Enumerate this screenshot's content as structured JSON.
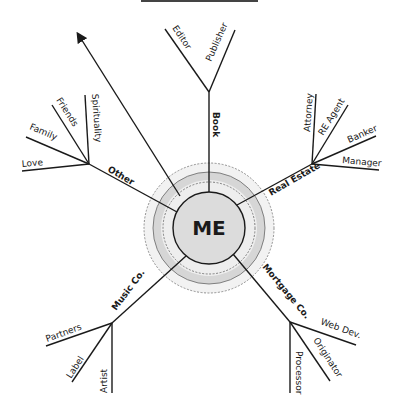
{
  "center": {
    "label": "ME"
  },
  "branches": {
    "book": {
      "label": "Book",
      "leaves": [
        "Editor",
        "Publisher"
      ]
    },
    "real_estate": {
      "label": "Real Estate",
      "leaves": [
        "Attorney",
        "RE Agent",
        "Banker",
        "Manager"
      ]
    },
    "mortgage": {
      "label": "Mortgage Co.",
      "leaves": [
        "Web Dev.",
        "Originator",
        "Processor"
      ]
    },
    "music": {
      "label": "Music Co.",
      "leaves": [
        "Partners",
        "Label",
        "Artist"
      ]
    },
    "other": {
      "label": "Other",
      "leaves": [
        "Love",
        "Family",
        "Friends",
        "Spirituality"
      ]
    }
  },
  "colors": {
    "ring": "#d4d4d4",
    "core": "#dcdcdc",
    "halo": "#ececec",
    "line": "#1a1a1a"
  }
}
